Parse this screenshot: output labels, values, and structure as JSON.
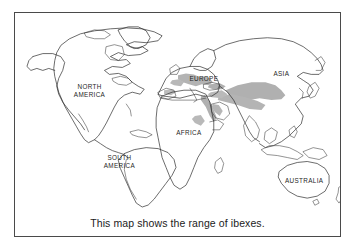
{
  "figure": {
    "type": "world-map-illustration",
    "caption": "This map shows the range of ibexes.",
    "frame_color": "#4a4a4a",
    "background_color": "#ffffff",
    "outline_color": "#2b2b2b",
    "range_fill_color": "#b3b3b3",
    "label_color": "#1f1f1f"
  },
  "map": {
    "continent_labels": [
      {
        "name": "north-america",
        "text": "NORTH AMERICA",
        "line1": "NORTH",
        "line2": "AMERICA",
        "x": 75,
        "y": 79
      },
      {
        "name": "south-america",
        "text": "SOUTH AMERICA",
        "line1": "SOUTH",
        "line2": "AMERICA",
        "x": 105,
        "y": 150
      },
      {
        "name": "europe",
        "text": "EUROPE",
        "line1": "EUROPE",
        "line2": "",
        "x": 190,
        "y": 78
      },
      {
        "name": "africa",
        "text": "AFRICA",
        "line1": "AFRICA",
        "line2": "",
        "x": 178,
        "y": 122
      },
      {
        "name": "asia",
        "text": "ASIA",
        "line1": "ASIA",
        "line2": "",
        "x": 266,
        "y": 72
      },
      {
        "name": "australia",
        "text": "AUSTRALIA",
        "line1": "AUSTRALIA",
        "line2": "",
        "x": 297,
        "y": 175
      }
    ],
    "range_regions": [
      {
        "name": "range-europe-alps",
        "label": "Alps / southern Europe"
      },
      {
        "name": "range-middle-east",
        "label": "Arabian peninsula / Red Sea"
      },
      {
        "name": "range-central-asia",
        "label": "Central Asia / Himalaya"
      },
      {
        "name": "range-northeast-africa",
        "label": "Northeast Africa"
      }
    ]
  }
}
